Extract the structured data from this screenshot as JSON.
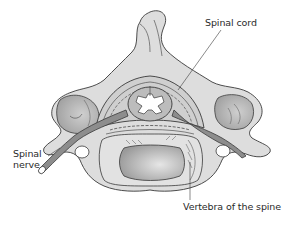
{
  "diagram": {
    "labels": {
      "spinal_cord": "Spinal cord",
      "spinal_nerve_line1": "Spinal",
      "spinal_nerve_line2": "nerve",
      "vertebra": "Vertebra of the spine"
    },
    "colors": {
      "bone": "#dcdcdc",
      "bone_shadow": "#b8b8b8",
      "vertebral_body": "#a9a9a9",
      "nerve": "#8a8a8a",
      "outline": "#3a3a3a",
      "background": "#ffffff"
    }
  }
}
